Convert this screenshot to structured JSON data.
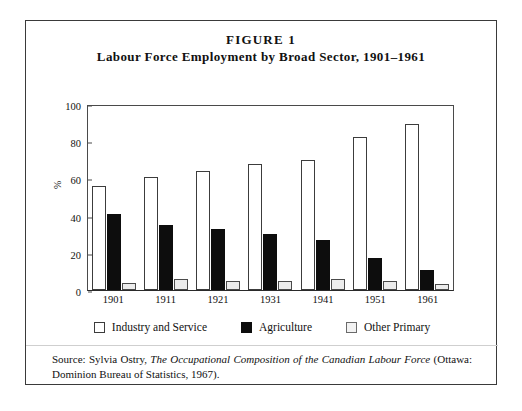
{
  "figure": {
    "number_label": "FIGURE 1",
    "title": "Labour Force Employment by Broad Sector, 1901–1961"
  },
  "source": {
    "prefix": "Source: Sylvia Ostry, ",
    "italic_title": "The Occupational Composition of the Canadian Labour Force",
    "suffix": " (Ottawa: Dominion Bureau of Statistics, 1967)."
  },
  "legend": {
    "position": "bottom-center",
    "items": [
      {
        "label": "Industry and Service",
        "swatch": "white-outline",
        "color": "#ffffff"
      },
      {
        "label": "Agriculture",
        "swatch": "black-filled",
        "color": "#0d0d0d"
      },
      {
        "label": "Other Primary",
        "swatch": "light-gray-outline",
        "color": "#ececec"
      }
    ]
  },
  "chart_data": {
    "type": "bar",
    "title": "Labour Force Employment by Broad Sector, 1901–1961",
    "xlabel": "",
    "ylabel": "%",
    "ylim": [
      0,
      100
    ],
    "yticks": [
      0,
      20,
      40,
      60,
      80,
      100
    ],
    "grid": false,
    "legend_position": "bottom-center",
    "categories": [
      "1901",
      "1911",
      "1921",
      "1931",
      "1941",
      "1951",
      "1961"
    ],
    "series": [
      {
        "name": "Industry and Service",
        "color": "#ffffff",
        "values": [
          56,
          61,
          64,
          68,
          70,
          82,
          89
        ]
      },
      {
        "name": "Agriculture",
        "color": "#0d0d0d",
        "values": [
          41,
          35,
          33,
          30,
          27,
          17,
          11
        ]
      },
      {
        "name": "Other Primary",
        "color": "#ececec",
        "values": [
          4,
          6,
          5,
          5,
          6,
          5,
          3
        ]
      }
    ]
  }
}
